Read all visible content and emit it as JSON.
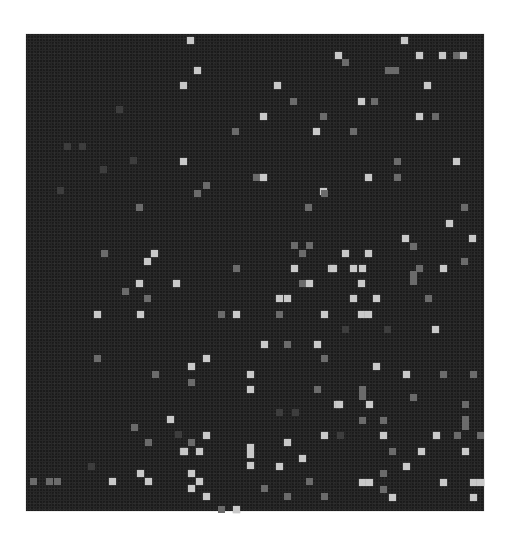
{
  "figure": {
    "colors": {
      "background": "#1b1b1b",
      "bright": "#c9c9c9",
      "mid": "#6b6b6b",
      "dim": "#3d3d3d",
      "page": "#ffffff"
    },
    "matrix_box": {
      "x": 26,
      "y": 34,
      "width": 458,
      "height": 477
    },
    "cells": [
      {
        "x": 190,
        "y": 40,
        "v": "b"
      },
      {
        "x": 404,
        "y": 40,
        "v": "b"
      },
      {
        "x": 338,
        "y": 55,
        "v": "b"
      },
      {
        "x": 419,
        "y": 55,
        "v": "b"
      },
      {
        "x": 442,
        "y": 55,
        "v": "b"
      },
      {
        "x": 456,
        "y": 55,
        "v": "m"
      },
      {
        "x": 463,
        "y": 55,
        "v": "b"
      },
      {
        "x": 345,
        "y": 62,
        "v": "m"
      },
      {
        "x": 197,
        "y": 70,
        "v": "b"
      },
      {
        "x": 392,
        "y": 70,
        "v": "m",
        "w": 2
      },
      {
        "x": 183,
        "y": 85,
        "v": "b"
      },
      {
        "x": 277,
        "y": 85,
        "v": "b"
      },
      {
        "x": 427,
        "y": 85,
        "v": "b"
      },
      {
        "x": 293,
        "y": 101,
        "v": "m"
      },
      {
        "x": 361,
        "y": 101,
        "v": "b"
      },
      {
        "x": 374,
        "y": 101,
        "v": "m"
      },
      {
        "x": 119,
        "y": 109,
        "v": "d"
      },
      {
        "x": 263,
        "y": 116,
        "v": "b"
      },
      {
        "x": 323,
        "y": 116,
        "v": "m"
      },
      {
        "x": 419,
        "y": 116,
        "v": "b"
      },
      {
        "x": 435,
        "y": 116,
        "v": "m"
      },
      {
        "x": 235,
        "y": 131,
        "v": "m"
      },
      {
        "x": 316,
        "y": 131,
        "v": "b"
      },
      {
        "x": 353,
        "y": 131,
        "v": "m"
      },
      {
        "x": 67,
        "y": 146,
        "v": "d"
      },
      {
        "x": 82,
        "y": 146,
        "v": "d"
      },
      {
        "x": 133,
        "y": 160,
        "v": "d"
      },
      {
        "x": 183,
        "y": 161,
        "v": "b"
      },
      {
        "x": 397,
        "y": 161,
        "v": "m"
      },
      {
        "x": 456,
        "y": 161,
        "v": "b"
      },
      {
        "x": 103,
        "y": 169,
        "v": "d"
      },
      {
        "x": 256,
        "y": 177,
        "v": "m"
      },
      {
        "x": 263,
        "y": 177,
        "v": "b"
      },
      {
        "x": 368,
        "y": 177,
        "v": "b"
      },
      {
        "x": 397,
        "y": 177,
        "v": "m"
      },
      {
        "x": 206,
        "y": 185,
        "v": "m"
      },
      {
        "x": 60,
        "y": 190,
        "v": "d"
      },
      {
        "x": 323,
        "y": 191,
        "v": "b"
      },
      {
        "x": 197,
        "y": 193,
        "v": "m"
      },
      {
        "x": 324,
        "y": 193,
        "v": "m"
      },
      {
        "x": 139,
        "y": 207,
        "v": "m"
      },
      {
        "x": 308,
        "y": 207,
        "v": "m"
      },
      {
        "x": 464,
        "y": 207,
        "v": "m"
      },
      {
        "x": 449,
        "y": 223,
        "v": "b"
      },
      {
        "x": 405,
        "y": 238,
        "v": "b"
      },
      {
        "x": 472,
        "y": 238,
        "v": "b"
      },
      {
        "x": 294,
        "y": 245,
        "v": "m"
      },
      {
        "x": 309,
        "y": 245,
        "v": "m"
      },
      {
        "x": 413,
        "y": 246,
        "v": "m"
      },
      {
        "x": 104,
        "y": 253,
        "v": "m"
      },
      {
        "x": 154,
        "y": 253,
        "v": "b"
      },
      {
        "x": 302,
        "y": 253,
        "v": "m"
      },
      {
        "x": 345,
        "y": 253,
        "v": "b"
      },
      {
        "x": 368,
        "y": 253,
        "v": "b"
      },
      {
        "x": 147,
        "y": 261,
        "v": "b"
      },
      {
        "x": 464,
        "y": 261,
        "v": "m"
      },
      {
        "x": 236,
        "y": 268,
        "v": "m"
      },
      {
        "x": 294,
        "y": 268,
        "v": "b"
      },
      {
        "x": 331,
        "y": 268,
        "v": "b"
      },
      {
        "x": 333,
        "y": 268,
        "v": "b"
      },
      {
        "x": 353,
        "y": 268,
        "v": "b"
      },
      {
        "x": 362,
        "y": 268,
        "v": "b"
      },
      {
        "x": 419,
        "y": 268,
        "v": "m"
      },
      {
        "x": 443,
        "y": 268,
        "v": "b"
      },
      {
        "x": 413,
        "y": 278,
        "v": "m",
        "h": 2
      },
      {
        "x": 139,
        "y": 283,
        "v": "b"
      },
      {
        "x": 176,
        "y": 283,
        "v": "b"
      },
      {
        "x": 302,
        "y": 283,
        "v": "m"
      },
      {
        "x": 309,
        "y": 283,
        "v": "b"
      },
      {
        "x": 361,
        "y": 283,
        "v": "b"
      },
      {
        "x": 125,
        "y": 291,
        "v": "m"
      },
      {
        "x": 147,
        "y": 298,
        "v": "m"
      },
      {
        "x": 279,
        "y": 298,
        "v": "b"
      },
      {
        "x": 287,
        "y": 298,
        "v": "b"
      },
      {
        "x": 353,
        "y": 298,
        "v": "b"
      },
      {
        "x": 376,
        "y": 298,
        "v": "b"
      },
      {
        "x": 428,
        "y": 298,
        "v": "m"
      },
      {
        "x": 97,
        "y": 314,
        "v": "b"
      },
      {
        "x": 140,
        "y": 314,
        "v": "b"
      },
      {
        "x": 221,
        "y": 314,
        "v": "m"
      },
      {
        "x": 236,
        "y": 314,
        "v": "b"
      },
      {
        "x": 279,
        "y": 314,
        "v": "m"
      },
      {
        "x": 324,
        "y": 314,
        "v": "b"
      },
      {
        "x": 361,
        "y": 314,
        "v": "b"
      },
      {
        "x": 368,
        "y": 314,
        "v": "b"
      },
      {
        "x": 345,
        "y": 329,
        "v": "d"
      },
      {
        "x": 387,
        "y": 329,
        "v": "d"
      },
      {
        "x": 435,
        "y": 329,
        "v": "b"
      },
      {
        "x": 264,
        "y": 344,
        "v": "b"
      },
      {
        "x": 287,
        "y": 344,
        "v": "m"
      },
      {
        "x": 317,
        "y": 344,
        "v": "b"
      },
      {
        "x": 97,
        "y": 358,
        "v": "m"
      },
      {
        "x": 206,
        "y": 358,
        "v": "b"
      },
      {
        "x": 324,
        "y": 358,
        "v": "m"
      },
      {
        "x": 191,
        "y": 366,
        "v": "b"
      },
      {
        "x": 376,
        "y": 366,
        "v": "b"
      },
      {
        "x": 155,
        "y": 374,
        "v": "m"
      },
      {
        "x": 250,
        "y": 374,
        "v": "b"
      },
      {
        "x": 406,
        "y": 374,
        "v": "b"
      },
      {
        "x": 443,
        "y": 374,
        "v": "m"
      },
      {
        "x": 473,
        "y": 374,
        "v": "m"
      },
      {
        "x": 191,
        "y": 382,
        "v": "m"
      },
      {
        "x": 250,
        "y": 389,
        "v": "b"
      },
      {
        "x": 317,
        "y": 389,
        "v": "m"
      },
      {
        "x": 362,
        "y": 393,
        "v": "m",
        "h": 2
      },
      {
        "x": 413,
        "y": 397,
        "v": "m"
      },
      {
        "x": 337,
        "y": 404,
        "v": "b"
      },
      {
        "x": 339,
        "y": 404,
        "v": "b"
      },
      {
        "x": 369,
        "y": 404,
        "v": "b"
      },
      {
        "x": 465,
        "y": 404,
        "v": "m"
      },
      {
        "x": 279,
        "y": 412,
        "v": "d"
      },
      {
        "x": 295,
        "y": 412,
        "v": "d"
      },
      {
        "x": 170,
        "y": 419,
        "v": "b"
      },
      {
        "x": 362,
        "y": 420,
        "v": "m"
      },
      {
        "x": 383,
        "y": 420,
        "v": "m"
      },
      {
        "x": 465,
        "y": 423,
        "v": "m",
        "h": 2
      },
      {
        "x": 134,
        "y": 427,
        "v": "m"
      },
      {
        "x": 178,
        "y": 434,
        "v": "d"
      },
      {
        "x": 206,
        "y": 435,
        "v": "b"
      },
      {
        "x": 324,
        "y": 435,
        "v": "b"
      },
      {
        "x": 340,
        "y": 435,
        "v": "d"
      },
      {
        "x": 383,
        "y": 435,
        "v": "b"
      },
      {
        "x": 436,
        "y": 435,
        "v": "b"
      },
      {
        "x": 457,
        "y": 435,
        "v": "m"
      },
      {
        "x": 480,
        "y": 435,
        "v": "m"
      },
      {
        "x": 148,
        "y": 442,
        "v": "m"
      },
      {
        "x": 191,
        "y": 442,
        "v": "m"
      },
      {
        "x": 287,
        "y": 442,
        "v": "b"
      },
      {
        "x": 183,
        "y": 451,
        "v": "b"
      },
      {
        "x": 184,
        "y": 451,
        "v": "b"
      },
      {
        "x": 199,
        "y": 451,
        "v": "b"
      },
      {
        "x": 250,
        "y": 451,
        "v": "b",
        "h": 2
      },
      {
        "x": 392,
        "y": 451,
        "v": "m"
      },
      {
        "x": 421,
        "y": 451,
        "v": "b"
      },
      {
        "x": 465,
        "y": 451,
        "v": "b"
      },
      {
        "x": 302,
        "y": 458,
        "v": "b"
      },
      {
        "x": 91,
        "y": 466,
        "v": "d"
      },
      {
        "x": 250,
        "y": 465,
        "v": "b"
      },
      {
        "x": 279,
        "y": 466,
        "v": "b"
      },
      {
        "x": 406,
        "y": 466,
        "v": "b"
      },
      {
        "x": 140,
        "y": 473,
        "v": "b"
      },
      {
        "x": 191,
        "y": 473,
        "v": "b"
      },
      {
        "x": 383,
        "y": 473,
        "v": "m"
      },
      {
        "x": 33,
        "y": 481,
        "v": "m"
      },
      {
        "x": 49,
        "y": 481,
        "v": "m"
      },
      {
        "x": 57,
        "y": 481,
        "v": "m"
      },
      {
        "x": 112,
        "y": 481,
        "v": "b"
      },
      {
        "x": 148,
        "y": 481,
        "v": "b"
      },
      {
        "x": 199,
        "y": 481,
        "v": "b"
      },
      {
        "x": 309,
        "y": 481,
        "v": "m"
      },
      {
        "x": 362,
        "y": 482,
        "v": "b"
      },
      {
        "x": 369,
        "y": 482,
        "v": "b"
      },
      {
        "x": 443,
        "y": 482,
        "v": "b"
      },
      {
        "x": 473,
        "y": 482,
        "v": "b"
      },
      {
        "x": 480,
        "y": 482,
        "v": "b"
      },
      {
        "x": 191,
        "y": 488,
        "v": "b"
      },
      {
        "x": 264,
        "y": 488,
        "v": "m"
      },
      {
        "x": 383,
        "y": 489,
        "v": "m"
      },
      {
        "x": 206,
        "y": 496,
        "v": "b"
      },
      {
        "x": 287,
        "y": 496,
        "v": "m"
      },
      {
        "x": 324,
        "y": 496,
        "v": "m"
      },
      {
        "x": 392,
        "y": 497,
        "v": "b"
      },
      {
        "x": 473,
        "y": 497,
        "v": "b"
      },
      {
        "x": 221,
        "y": 509,
        "v": "m"
      },
      {
        "x": 236,
        "y": 509,
        "v": "b"
      }
    ]
  }
}
